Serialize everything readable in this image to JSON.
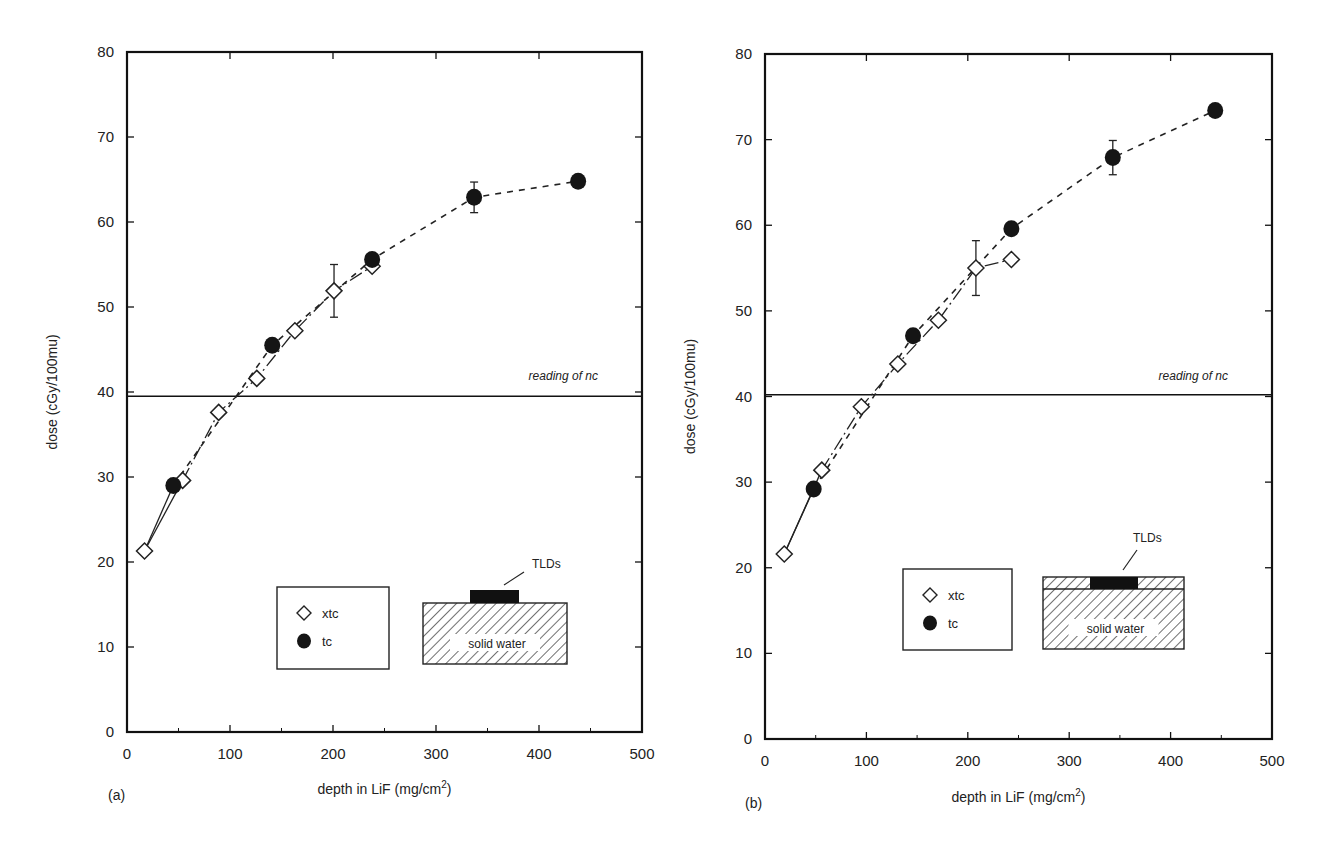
{
  "chart_data": [
    {
      "panel": "(a)",
      "type": "scatter",
      "xlabel": "depth in LiF (mg/cm2)",
      "xlabel_main": "depth in LiF (mg/cm",
      "xlabel_sup": "2",
      "xlabel_end": ")",
      "ylabel": "dose (cGy/100mu)",
      "xlim": [
        0,
        500
      ],
      "ylim": [
        0,
        80
      ],
      "xticks": [
        0,
        100,
        200,
        300,
        400,
        500
      ],
      "yticks": [
        0,
        10,
        20,
        30,
        40,
        50,
        60,
        70,
        80
      ],
      "grid": false,
      "reference_line": {
        "y": 39.5,
        "label": "reading of nc"
      },
      "legend": {
        "position": "lower-center",
        "entries": [
          "xtc",
          "tc"
        ]
      },
      "inset": {
        "label_top": "TLDs",
        "label_body": "solid water",
        "variant": "on-surface"
      },
      "series": [
        {
          "name": "xtc",
          "marker": "open-diamond",
          "line": "solid/dash-dot",
          "points": [
            {
              "x": 17,
              "y": 21.3
            },
            {
              "x": 54,
              "y": 29.6
            },
            {
              "x": 89,
              "y": 37.6
            },
            {
              "x": 126,
              "y": 41.6
            },
            {
              "x": 163,
              "y": 47.2
            },
            {
              "x": 201,
              "y": 51.9,
              "err": 3.1
            },
            {
              "x": 238,
              "y": 54.8
            }
          ]
        },
        {
          "name": "tc",
          "marker": "filled-circle",
          "line": "dashed",
          "points": [
            {
              "x": 45,
              "y": 29.0
            },
            {
              "x": 141,
              "y": 45.5
            },
            {
              "x": 238,
              "y": 55.6
            },
            {
              "x": 337,
              "y": 62.9,
              "err": 1.8
            },
            {
              "x": 438,
              "y": 64.8
            }
          ]
        }
      ]
    },
    {
      "panel": "(b)",
      "type": "scatter",
      "xlabel": "depth in LiF (mg/cm2)",
      "xlabel_main": "depth in LiF (mg/cm",
      "xlabel_sup": "2",
      "xlabel_end": ")",
      "ylabel": "dose (cGy/100mu)",
      "xlim": [
        0,
        500
      ],
      "ylim": [
        0,
        80
      ],
      "xticks": [
        0,
        100,
        200,
        300,
        400,
        500
      ],
      "yticks": [
        0,
        10,
        20,
        30,
        40,
        50,
        60,
        70,
        80
      ],
      "grid": false,
      "reference_line": {
        "y": 40.2,
        "label": "reading of nc"
      },
      "legend": {
        "position": "lower-center",
        "entries": [
          "xtc",
          "tc"
        ]
      },
      "inset": {
        "label_top": "TLDs",
        "label_body": "solid water",
        "variant": "embedded"
      },
      "series": [
        {
          "name": "xtc",
          "marker": "open-diamond",
          "line": "solid/dash-dot",
          "points": [
            {
              "x": 19,
              "y": 21.6
            },
            {
              "x": 56,
              "y": 31.4
            },
            {
              "x": 95,
              "y": 38.8
            },
            {
              "x": 131,
              "y": 43.8
            },
            {
              "x": 171,
              "y": 48.9
            },
            {
              "x": 208,
              "y": 55.0,
              "err": 3.2
            },
            {
              "x": 243,
              "y": 56.0
            }
          ]
        },
        {
          "name": "tc",
          "marker": "filled-circle",
          "line": "dashed",
          "points": [
            {
              "x": 48,
              "y": 29.2
            },
            {
              "x": 146,
              "y": 47.1
            },
            {
              "x": 243,
              "y": 59.6
            },
            {
              "x": 343,
              "y": 67.9,
              "err": 2.0
            },
            {
              "x": 444,
              "y": 73.4
            }
          ]
        }
      ]
    }
  ]
}
